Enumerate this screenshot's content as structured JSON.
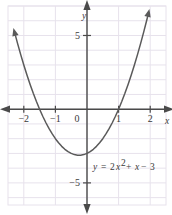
{
  "chart_data": {
    "type": "line",
    "title": "",
    "subtitle": "",
    "xlabel": "x",
    "ylabel": "y",
    "equation_label": "y = 2x² + x − 3",
    "equation_parts": {
      "lhs": "y",
      "equals": "=",
      "coef": "2",
      "var": "x",
      "exponent": "2",
      "plus": "+",
      "linear": "x",
      "minus": "−",
      "constant": "3"
    },
    "function": "y = 2x^2 + x - 3",
    "coefficients": {
      "a": 2,
      "b": 1,
      "c": -3
    },
    "vertex": {
      "x": -0.25,
      "y": -3.125
    },
    "roots": [
      -1.5,
      1.0
    ],
    "y_intercept": -3,
    "xlim": [
      -2.5,
      2.5
    ],
    "ylim": [
      -6.5,
      7.0
    ],
    "grid": true,
    "grid_step": 1,
    "legend": "none",
    "x_ticks": [
      -2,
      -1,
      0,
      1,
      2
    ],
    "x_tick_labels": [
      "−2",
      "−1",
      "0",
      "1",
      "2"
    ],
    "y_ticks": [
      5,
      -5
    ],
    "y_tick_labels": [
      "5",
      "−5"
    ],
    "axis_arrows": [
      "left",
      "right",
      "up",
      "down"
    ],
    "curve_arrows": [
      "upper-left",
      "upper-right"
    ],
    "colors": {
      "background": "#ffffff",
      "grid": "#e7e2ec",
      "axis": "#4a4a4a",
      "curve": "#5a5a5a",
      "text": "#3a3a3a"
    },
    "points": [
      {
        "x": -2.3,
        "y": 5.28
      },
      {
        "x": -2.2,
        "y": 4.48
      },
      {
        "x": -2.1,
        "y": 3.72
      },
      {
        "x": -2.0,
        "y": 3.0
      },
      {
        "x": -1.9,
        "y": 2.32
      },
      {
        "x": -1.8,
        "y": 1.68
      },
      {
        "x": -1.7,
        "y": 1.08
      },
      {
        "x": -1.6,
        "y": 0.52
      },
      {
        "x": -1.5,
        "y": 0.0
      },
      {
        "x": -1.4,
        "y": -0.48
      },
      {
        "x": -1.3,
        "y": -0.92
      },
      {
        "x": -1.2,
        "y": -1.32
      },
      {
        "x": -1.1,
        "y": -1.68
      },
      {
        "x": -1.0,
        "y": -2.0
      },
      {
        "x": -0.9,
        "y": -2.28
      },
      {
        "x": -0.8,
        "y": -2.52
      },
      {
        "x": -0.7,
        "y": -2.72
      },
      {
        "x": -0.6,
        "y": -2.88
      },
      {
        "x": -0.5,
        "y": -3.0
      },
      {
        "x": -0.4,
        "y": -3.08
      },
      {
        "x": -0.3,
        "y": -3.12
      },
      {
        "x": -0.25,
        "y": -3.125
      },
      {
        "x": -0.2,
        "y": -3.12
      },
      {
        "x": -0.1,
        "y": -3.08
      },
      {
        "x": 0.0,
        "y": -3.0
      },
      {
        "x": 0.1,
        "y": -2.88
      },
      {
        "x": 0.2,
        "y": -2.72
      },
      {
        "x": 0.3,
        "y": -2.52
      },
      {
        "x": 0.4,
        "y": -2.28
      },
      {
        "x": 0.5,
        "y": -2.0
      },
      {
        "x": 0.6,
        "y": -1.68
      },
      {
        "x": 0.7,
        "y": -1.32
      },
      {
        "x": 0.8,
        "y": -0.92
      },
      {
        "x": 0.9,
        "y": -0.48
      },
      {
        "x": 1.0,
        "y": 0.0
      },
      {
        "x": 1.1,
        "y": 0.52
      },
      {
        "x": 1.2,
        "y": 1.08
      },
      {
        "x": 1.3,
        "y": 1.68
      },
      {
        "x": 1.4,
        "y": 2.32
      },
      {
        "x": 1.5,
        "y": 3.0
      },
      {
        "x": 1.6,
        "y": 3.72
      },
      {
        "x": 1.7,
        "y": 4.48
      },
      {
        "x": 1.8,
        "y": 5.28
      },
      {
        "x": 1.9,
        "y": 6.12
      },
      {
        "x": 1.95,
        "y": 6.56
      }
    ]
  }
}
